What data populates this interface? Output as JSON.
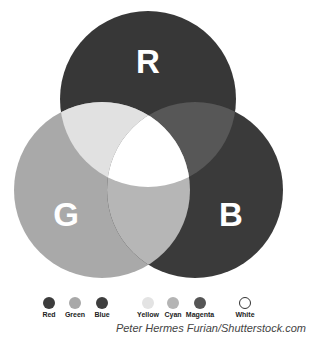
{
  "diagram": {
    "type": "venn-additive-color",
    "circles": [
      {
        "key": "R",
        "label": "R",
        "color": "#373737",
        "cx": 148,
        "cy": 99,
        "r": 88
      },
      {
        "key": "G",
        "label": "G",
        "color": "#a9a9a9",
        "cx": 102,
        "cy": 190,
        "r": 88
      },
      {
        "key": "B",
        "label": "B",
        "color": "#3a3a3a",
        "cx": 195,
        "cy": 190,
        "r": 88
      }
    ],
    "overlaps": {
      "RG": "#e1e1e1",
      "RB": "#575757",
      "GB": "#b6b6b6",
      "RGB": "#ffffff"
    }
  },
  "legend": [
    {
      "label": "Red",
      "color": "#3c3c3c",
      "x": 49
    },
    {
      "label": "Green",
      "color": "#a8a8a8",
      "x": 75
    },
    {
      "label": "Blue",
      "color": "#3e3e3e",
      "x": 102
    },
    {
      "label": "Yellow",
      "color": "#e3e3e3",
      "x": 148
    },
    {
      "label": "Cyan",
      "color": "#b4b4b4",
      "x": 173
    },
    {
      "label": "Magenta",
      "color": "#555555",
      "x": 200
    },
    {
      "label": "White",
      "color": "#ffffff",
      "x": 245
    }
  ],
  "credit": "Peter Hermes Furian/Shutterstock.com"
}
